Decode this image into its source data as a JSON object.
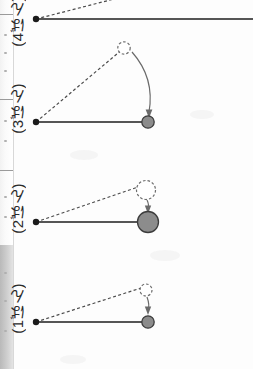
{
  "page": {
    "width": 253,
    "height": 369,
    "background_color": "#fdfdfd"
  },
  "edge_strip": {
    "name": "scanned-page-edge",
    "gray_block_color": "#c2c2c2",
    "divider_color": "#9a9a9a",
    "dividers_y": [
      14,
      99,
      170,
      245
    ],
    "gray_block": {
      "top": 245,
      "height": 124
    }
  },
  "labels": [
    {
      "id": "label-4",
      "text": "(4ばん)",
      "x": 10,
      "y": -4,
      "clipped": true
    },
    {
      "id": "label-3",
      "text": "(3ばん)",
      "x": 10,
      "y": 83,
      "clipped": false
    },
    {
      "id": "label-2",
      "text": "(2ばん)",
      "x": 10,
      "y": 183,
      "clipped": false
    },
    {
      "id": "label-1",
      "text": "(1ばん)",
      "x": 10,
      "y": 283,
      "clipped": false
    }
  ],
  "diagrams": [
    {
      "id": "pendulum-4",
      "label": "(4ばん)",
      "clipped_top": true,
      "pivot": {
        "x": 36,
        "y": 19,
        "r": 3.2
      },
      "bob": {
        "x": 253,
        "y": 19,
        "r": 0,
        "visible": false
      },
      "rod_end": {
        "x": 253,
        "y": 19
      },
      "release_bob": {
        "x": 128,
        "y": -6,
        "r": 7,
        "visible": false
      },
      "dashed_end": {
        "x": 120,
        "y": 0
      },
      "arrow": {
        "visible": false
      },
      "rod_length_px": 217,
      "amplitude_note": "rod extends beyond right edge; release circle cut off above"
    },
    {
      "id": "pendulum-3",
      "label": "(3ばん)",
      "clipped_top": false,
      "pivot": {
        "x": 36,
        "y": 122,
        "r": 3.2
      },
      "bob": {
        "x": 148,
        "y": 122,
        "r": 6.2
      },
      "rod_end": {
        "x": 148,
        "y": 122
      },
      "release_bob": {
        "x": 124,
        "y": 48,
        "r": 6.2,
        "visible": true
      },
      "dashed_end": {
        "x": 124,
        "y": 48
      },
      "arrow": {
        "visible": true,
        "from_x": 131,
        "from_y": 52,
        "to_x": 150,
        "to_y": 114,
        "curve_x": 152,
        "curve_y": 76
      },
      "rod_length_px": 112,
      "amplitude_note": "largest swing angle"
    },
    {
      "id": "pendulum-2",
      "label": "(2ばん)",
      "clipped_top": false,
      "pivot": {
        "x": 36,
        "y": 222,
        "r": 3.2
      },
      "bob": {
        "x": 148,
        "y": 222,
        "r": 10.5
      },
      "rod_end": {
        "x": 148,
        "y": 222
      },
      "release_bob": {
        "x": 146,
        "y": 190,
        "r": 9.5,
        "visible": true
      },
      "dashed_end": {
        "x": 139,
        "y": 187
      },
      "arrow": {
        "visible": true,
        "from_x": 147,
        "from_y": 200,
        "to_x": 148,
        "to_y": 212,
        "curve_x": 149,
        "curve_y": 206
      },
      "rod_length_px": 112,
      "amplitude_note": "heaviest bob, small swing angle"
    },
    {
      "id": "pendulum-1",
      "label": "(1ばん)",
      "clipped_top": false,
      "pivot": {
        "x": 36,
        "y": 322,
        "r": 3.2
      },
      "bob": {
        "x": 148,
        "y": 322,
        "r": 6.2
      },
      "rod_end": {
        "x": 148,
        "y": 322
      },
      "release_bob": {
        "x": 146,
        "y": 290,
        "r": 6.0,
        "visible": true
      },
      "dashed_end": {
        "x": 141,
        "y": 288
      },
      "arrow": {
        "visible": true,
        "from_x": 147,
        "from_y": 297,
        "to_x": 148,
        "to_y": 313,
        "curve_x": 149,
        "curve_y": 305
      },
      "rod_length_px": 112,
      "amplitude_note": "small swing angle, light bob"
    }
  ],
  "legend_semantics": {
    "pivot_dot": "支点",
    "solid_line": "ふりこの糸（静止位置）",
    "dashed_line": "手をはなす位置",
    "hollow_circle": "はなす前のおもり",
    "filled_circle": "おもり",
    "curved_arrow": "ふれる向き"
  },
  "colors": {
    "ink": "#2a2a2a",
    "rod": "#555555",
    "bob_fill": "#8c8c8c",
    "bob_stroke": "#3c3c3c",
    "dash": "#4b4b4b",
    "edge_gray": "#c2c2c2"
  }
}
